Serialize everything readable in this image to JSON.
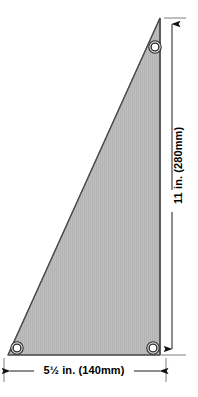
{
  "diagram": {
    "shape": {
      "name": "right-triangle-panel",
      "fill_color": "#bdbdbd",
      "stroke_color": "#3a3a3a",
      "vertices": [
        {
          "name": "apex-top-right",
          "x": 160,
          "y": 18
        },
        {
          "name": "corner-bottom-right",
          "x": 160,
          "y": 355
        },
        {
          "name": "corner-bottom-left",
          "x": 8,
          "y": 355
        }
      ]
    },
    "grommets": [
      {
        "name": "grommet-top-right",
        "cx": 155,
        "cy": 47,
        "outer_r": 6,
        "inner_r": 3
      },
      {
        "name": "grommet-bottom-right",
        "cx": 153,
        "cy": 348,
        "outer_r": 6,
        "inner_r": 3
      },
      {
        "name": "grommet-bottom-left",
        "cx": 17,
        "cy": 348,
        "outer_r": 6,
        "inner_r": 3
      }
    ],
    "dimensions": {
      "vertical": {
        "label": "11 in. (280mm)",
        "value_in": "11",
        "value_mm": "280",
        "line_x": 172,
        "top_y": 18,
        "bottom_y": 355,
        "orientation": "vertical"
      },
      "horizontal": {
        "label": "5½ in. (140mm)",
        "value_in": "5½",
        "value_mm": "140",
        "line_y": 371,
        "left_x": 8,
        "right_x": 160,
        "orientation": "horizontal"
      }
    },
    "colors": {
      "background": "#ffffff",
      "panel_fill": "#bdbdbd",
      "panel_stroke": "#3a3a3a",
      "dimension_line": "#1a1a1a",
      "text": "#000000",
      "grommet_ring": "#2b2b2b",
      "grommet_center": "#ffffff"
    }
  }
}
